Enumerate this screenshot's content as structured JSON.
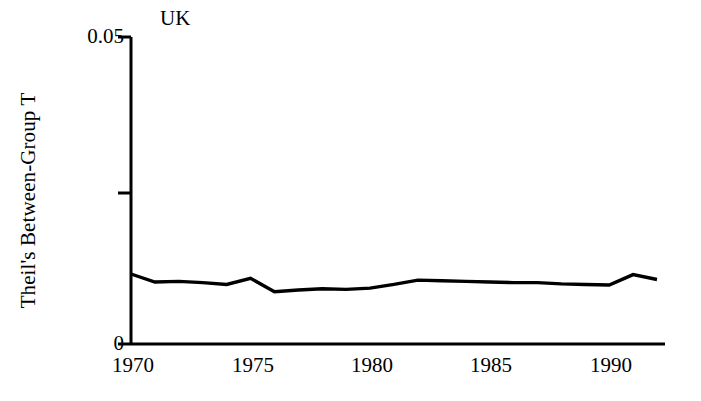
{
  "chart_data": {
    "type": "line",
    "title": "",
    "annotation": "UK",
    "xlabel": "",
    "ylabel": "Theil's Between-Group T",
    "xlim": [
      1970,
      1992
    ],
    "ylim": [
      0,
      0.05
    ],
    "grid": false,
    "legend": "none",
    "y_ticks": [
      {
        "value": 0.05,
        "label": "0.05"
      },
      {
        "value": 0.025,
        "label": ""
      },
      {
        "value": 0,
        "label": "0"
      }
    ],
    "x_ticks": [
      {
        "value": 1970,
        "label": "1970"
      },
      {
        "value": 1975,
        "label": "1975"
      },
      {
        "value": 1980,
        "label": "1980"
      },
      {
        "value": 1985,
        "label": "1985"
      },
      {
        "value": 1990,
        "label": "1990"
      }
    ],
    "series": [
      {
        "name": "UK",
        "color": "#000000",
        "x": [
          1970,
          1971,
          1972,
          1973,
          1974,
          1975,
          1976,
          1977,
          1978,
          1979,
          1980,
          1981,
          1982,
          1983,
          1984,
          1985,
          1986,
          1987,
          1988,
          1989,
          1990,
          1991,
          1992
        ],
        "values": [
          0.0114,
          0.0101,
          0.0102,
          0.01,
          0.0097,
          0.0107,
          0.0085,
          0.0088,
          0.009,
          0.0089,
          0.0091,
          0.0097,
          0.0104,
          0.0103,
          0.0102,
          0.0101,
          0.01,
          0.01,
          0.0098,
          0.0097,
          0.0096,
          0.0113,
          0.0105
        ]
      }
    ]
  },
  "axes": {
    "y_axis_name": "y-axis",
    "x_axis_name": "x-axis"
  }
}
